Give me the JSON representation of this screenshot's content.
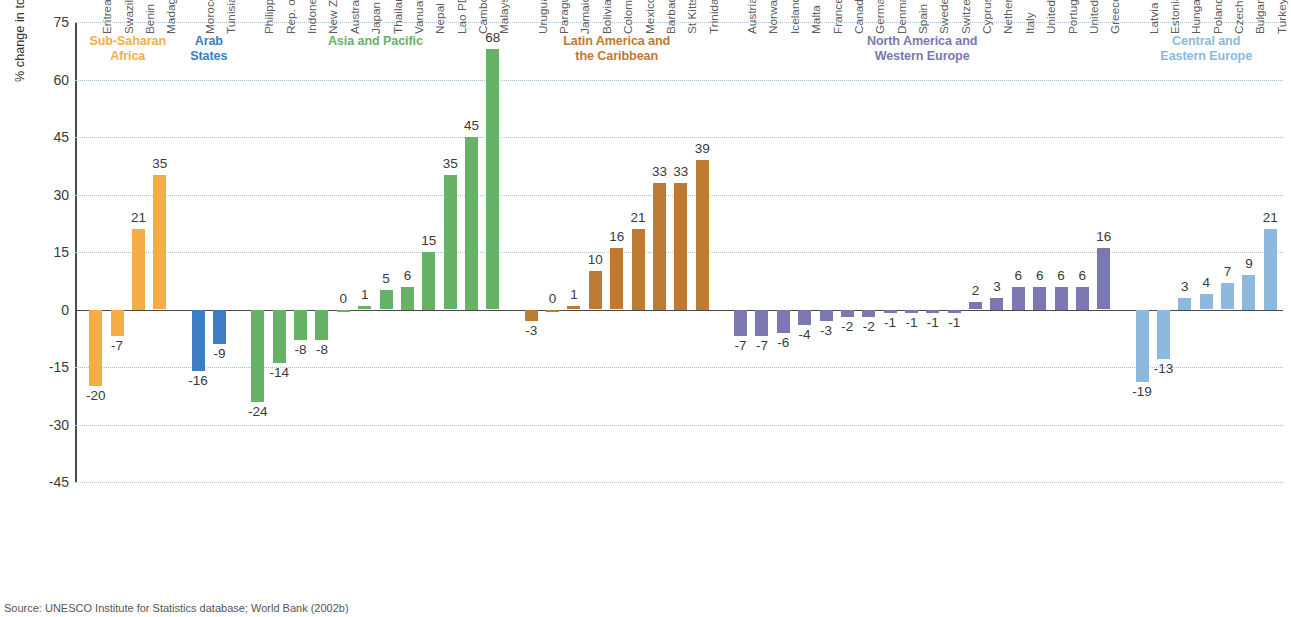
{
  "axis": {
    "ylabel": "% change in total education expenditure",
    "yticks": [
      75,
      60,
      45,
      30,
      15,
      0,
      -15,
      -30,
      -45
    ],
    "ymin": -45,
    "ymax": 75
  },
  "source": "Source: UNESCO Institute for Statistics database; World Bank (2002b)",
  "colors": {
    "sub_saharan_africa": "#F5AE45",
    "arab_states": "#3D7DC4",
    "asia_and_pacific": "#66B267",
    "latin_america_caribbean": "#BD7B31",
    "north_america_western_europe": "#7B78B0",
    "central_eastern_europe": "#8CB9DD",
    "gridline": "#9fc6e8",
    "axis": "#4a4a4a"
  },
  "chart_data": {
    "type": "bar",
    "title": "",
    "xlabel": "",
    "ylabel": "% change in total education expenditure",
    "ylim": [
      -45,
      75
    ],
    "yticks": [
      -45,
      -30,
      -15,
      0,
      15,
      30,
      45,
      60,
      75
    ],
    "grid": true,
    "legend": "none",
    "groups": [
      {
        "name": "Sub-Saharan Africa",
        "title_lines": [
          "Sub-Saharan",
          "Africa"
        ],
        "color": "#F5AE45",
        "categories": [
          "Eritrea",
          "Swaziland",
          "Benin",
          "Madagascar"
        ],
        "values": [
          -20,
          -7,
          21,
          35
        ]
      },
      {
        "name": "Arab States",
        "title_lines": [
          "Arab",
          "States"
        ],
        "color": "#3D7DC4",
        "categories": [
          "Morocco",
          "Tunisia"
        ],
        "values": [
          -16,
          -9
        ]
      },
      {
        "name": "Asia and Pacific",
        "title_lines": [
          "Asia and Pacific"
        ],
        "color": "#66B267",
        "categories": [
          "Philippines",
          "Rep. of Korea",
          "Indonesia",
          "New Zealand",
          "Australia",
          "Japan",
          "Thailand",
          "Vanuatu",
          "Nepal",
          "Lao PDR",
          "Cambodia",
          "Malaysia"
        ],
        "values": [
          -24,
          -14,
          -8,
          -8,
          0,
          1,
          5,
          6,
          15,
          35,
          45,
          68
        ]
      },
      {
        "name": "Latin America and the Caribbean",
        "title_lines": [
          "Latin America and",
          "the Caribbean"
        ],
        "color": "#BD7B31",
        "categories": [
          "Uruguay",
          "Paraguay",
          "Jamaica",
          "Bolivia",
          "Colombia",
          "Mexico",
          "Barbados",
          "St Kitts/Nevis",
          "Trinidad/Tobago"
        ],
        "values": [
          -3,
          0,
          1,
          10,
          16,
          21,
          33,
          33,
          39
        ]
      },
      {
        "name": "North America and Western Europe",
        "title_lines": [
          "North America and",
          "Western Europe"
        ],
        "color": "#7B78B0",
        "categories": [
          "Austria",
          "Norway",
          "Iceland",
          "Malta",
          "France",
          "Canada",
          "Germany",
          "Denmark",
          "Spain",
          "Sweden",
          "Switzerland",
          "Cyprus",
          "Netherlands",
          "Italy",
          "United Kingdom",
          "Portugal",
          "United States",
          "Greece"
        ],
        "values": [
          -7,
          -7,
          -6,
          -4,
          -3,
          -2,
          -2,
          -1,
          -1,
          -1,
          -1,
          2,
          3,
          6,
          6,
          6,
          6,
          16
        ]
      },
      {
        "name": "Central and Eastern Europe",
        "title_lines": [
          "Central and",
          "Eastern Europe"
        ],
        "color": "#8CB9DD",
        "categories": [
          "Latvia",
          "Estonia",
          "Hungary",
          "Poland",
          "Czech Rep.",
          "Bulgaria",
          "Turkey"
        ],
        "values": [
          -19,
          -13,
          3,
          4,
          7,
          9,
          21
        ]
      }
    ]
  }
}
